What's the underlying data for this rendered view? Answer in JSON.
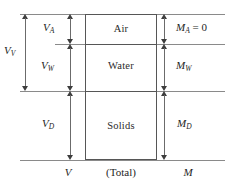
{
  "figure": {
    "box": {
      "phases": [
        {
          "name": "air",
          "label": "Air"
        },
        {
          "name": "water",
          "label": "Water"
        },
        {
          "name": "solids",
          "label": "Solids"
        }
      ]
    },
    "volume_dimensions": [
      {
        "name": "total-voids-volume",
        "label": "V",
        "sub": "V"
      },
      {
        "name": "air-volume",
        "label": "V",
        "sub": "A"
      },
      {
        "name": "water-volume",
        "label": "V",
        "sub": "W"
      },
      {
        "name": "solids-volume",
        "label": "V",
        "sub": "D"
      }
    ],
    "mass_dimensions": [
      {
        "name": "air-mass",
        "label": "M",
        "sub": "A",
        "equals": " = 0"
      },
      {
        "name": "water-mass",
        "label": "M",
        "sub": "W",
        "equals": ""
      },
      {
        "name": "solids-mass",
        "label": "M",
        "sub": "D",
        "equals": ""
      }
    ],
    "captions": {
      "volume": "V",
      "total": "(Total)",
      "mass": "M"
    },
    "colors": {
      "box_stroke": "#565656",
      "rule": "#8a8a8a",
      "arrow": "#3d3d3d",
      "text": "#1e1e1e",
      "background": "#ffffff"
    }
  }
}
